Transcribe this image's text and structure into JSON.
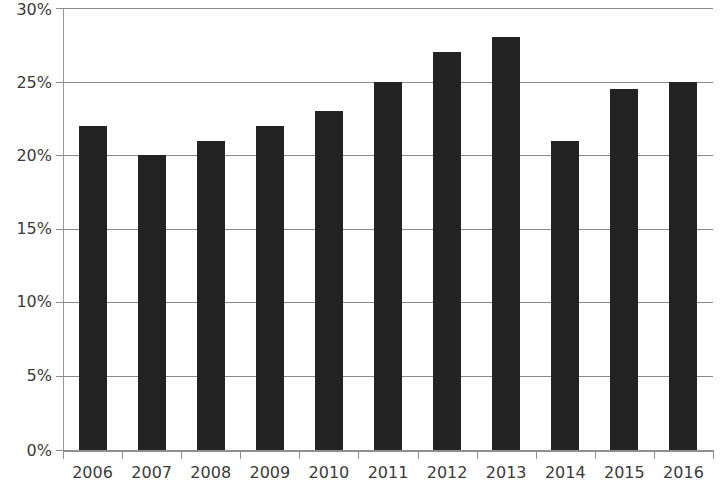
{
  "chart_data": {
    "type": "bar",
    "title": "",
    "xlabel": "",
    "ylabel": "",
    "categories": [
      "2006",
      "2007",
      "2008",
      "2009",
      "2010",
      "2011",
      "2012",
      "2013",
      "2014",
      "2015",
      "2016"
    ],
    "values": [
      22,
      20,
      21,
      22,
      23,
      25,
      27,
      28,
      21,
      24.5,
      25
    ],
    "ylim": [
      0,
      30
    ],
    "ytick_values": [
      0,
      5,
      10,
      15,
      20,
      25,
      30
    ],
    "ytick_labels": [
      "0%",
      "5%",
      "10%",
      "15%",
      "20%",
      "25%",
      "30%"
    ],
    "grid": true,
    "legend": "none",
    "bar_color": "#232323",
    "gridline_color": "#8a8a8a",
    "axis_color": "#8f8f8f",
    "label_color": "#3b3b3b"
  }
}
